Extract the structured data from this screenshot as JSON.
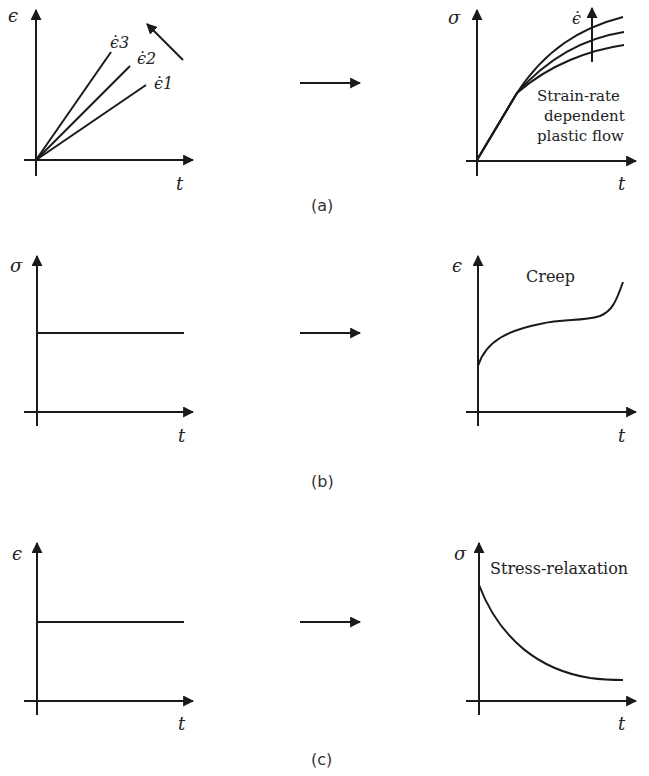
{
  "figure": {
    "panels": [
      {
        "caption": "(a)",
        "input": {
          "y_label": "ϵ",
          "x_label": "t",
          "series_labels": [
            "ϵ̇3",
            "ϵ̇2",
            "ϵ̇1"
          ],
          "note": "increasing strain rate arrow"
        },
        "output": {
          "y_label": "σ",
          "x_label": "t",
          "arrow_label": "ϵ̇",
          "annotation_lines": [
            "Strain-rate",
            "dependent",
            "plastic flow"
          ]
        }
      },
      {
        "caption": "(b)",
        "input": {
          "y_label": "σ",
          "x_label": "t"
        },
        "output": {
          "y_label": "ϵ",
          "x_label": "t",
          "annotation": "Creep"
        }
      },
      {
        "caption": "(c)",
        "input": {
          "y_label": "ϵ",
          "x_label": "t"
        },
        "output": {
          "y_label": "σ",
          "x_label": "t",
          "annotation": "Stress-relaxation"
        }
      }
    ],
    "colors": {
      "ink": "#1a1a1a",
      "background": "#ffffff"
    }
  }
}
